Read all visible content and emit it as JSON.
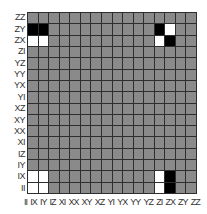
{
  "chart_data": {
    "type": "heatmap",
    "title": "",
    "xlabel": "",
    "ylabel": "",
    "x_tick_labels": [
      "II",
      "IX",
      "IY",
      "IZ",
      "XI",
      "XX",
      "XY",
      "XZ",
      "YI",
      "YX",
      "YY",
      "YZ",
      "ZI",
      "ZX",
      "ZY",
      "ZZ"
    ],
    "y_tick_labels_top_to_bottom": [
      "ZZ",
      "ZY",
      "ZX",
      "ZI",
      "YZ",
      "YY",
      "YX",
      "YI",
      "XZ",
      "XY",
      "XX",
      "XI",
      "IZ",
      "IY",
      "IX",
      "II"
    ],
    "value_range": [
      -1,
      1
    ],
    "colormap": {
      "-1": "#000000",
      "0": "#8a8a8a",
      "1": "#ffffff"
    },
    "grid": true,
    "legend": "none",
    "nonzero_cells": [
      {
        "row": "ZY",
        "col": "II",
        "value": -1
      },
      {
        "row": "ZY",
        "col": "IX",
        "value": -1
      },
      {
        "row": "ZY",
        "col": "ZI",
        "value": -1
      },
      {
        "row": "ZY",
        "col": "ZX",
        "value": 1
      },
      {
        "row": "ZX",
        "col": "II",
        "value": 1
      },
      {
        "row": "ZX",
        "col": "IX",
        "value": 1
      },
      {
        "row": "ZX",
        "col": "ZI",
        "value": 1
      },
      {
        "row": "ZX",
        "col": "ZX",
        "value": -1
      },
      {
        "row": "IX",
        "col": "II",
        "value": 1
      },
      {
        "row": "IX",
        "col": "IX",
        "value": 1
      },
      {
        "row": "IX",
        "col": "ZI",
        "value": 1
      },
      {
        "row": "IX",
        "col": "ZX",
        "value": -1
      },
      {
        "row": "II",
        "col": "II",
        "value": 1
      },
      {
        "row": "II",
        "col": "IX",
        "value": 1
      },
      {
        "row": "II",
        "col": "ZI",
        "value": 1
      },
      {
        "row": "II",
        "col": "ZX",
        "value": -1
      }
    ]
  }
}
